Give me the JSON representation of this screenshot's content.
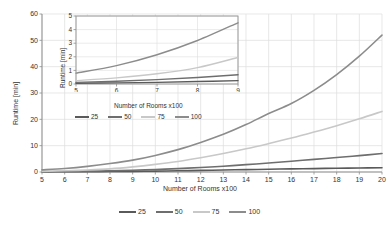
{
  "chart_data": [
    {
      "id": "main",
      "type": "line",
      "title": "",
      "xlabel": "Number of Rooms x100",
      "ylabel": "Runtime [min]",
      "xlim": [
        5,
        20
      ],
      "ylim": [
        0,
        60
      ],
      "xticks": [
        5,
        6,
        7,
        8,
        9,
        10,
        11,
        12,
        13,
        14,
        15,
        16,
        17,
        18,
        19,
        20
      ],
      "yticks": [
        0,
        10,
        20,
        30,
        40,
        50,
        60
      ],
      "xtick_labels": [
        "5",
        "6",
        "7",
        "8",
        "9",
        "10",
        "11",
        "12",
        "13",
        "14",
        "15",
        "16",
        "17",
        "18",
        "19",
        "20"
      ],
      "ytick_labels": [
        "0",
        "10",
        "20",
        "30",
        "40",
        "50",
        "60"
      ],
      "grid": true,
      "legend_position": "bottom",
      "x": [
        5,
        6,
        7,
        8,
        9,
        10,
        11,
        12,
        13,
        14,
        15,
        16,
        17,
        18,
        19,
        20
      ],
      "series": [
        {
          "name": "25",
          "color": "#5a5a5a",
          "values": [
            0.05,
            0.08,
            0.12,
            0.18,
            0.25,
            0.35,
            0.45,
            0.6,
            0.75,
            0.9,
            1.05,
            1.2,
            1.3,
            1.42,
            1.52,
            1.6
          ]
        },
        {
          "name": "50",
          "color": "#6e6e6e",
          "values": [
            0.12,
            0.2,
            0.32,
            0.48,
            0.68,
            0.95,
            1.3,
            1.7,
            2.2,
            2.8,
            3.4,
            4.1,
            4.8,
            5.5,
            6.2,
            7.0
          ]
        },
        {
          "name": "75",
          "color": "#c8c8c8",
          "values": [
            0.25,
            0.45,
            0.75,
            1.2,
            1.95,
            2.9,
            4.0,
            5.4,
            7.0,
            8.8,
            10.8,
            12.9,
            15.2,
            17.6,
            20.2,
            23.0
          ]
        },
        {
          "name": "100",
          "color": "#8c8c8c",
          "values": [
            0.8,
            1.35,
            2.15,
            3.2,
            4.5,
            6.3,
            8.5,
            11.2,
            14.3,
            18.0,
            22.2,
            26.0,
            31.0,
            37.0,
            44.0,
            52.0
          ]
        }
      ]
    },
    {
      "id": "inset",
      "type": "line",
      "title": "",
      "xlabel": "Number of Rooms x100",
      "ylabel": "Runtime [min]",
      "xlim": [
        5,
        9
      ],
      "ylim": [
        0,
        5
      ],
      "xticks": [
        5,
        6,
        7,
        8,
        9
      ],
      "yticks": [
        0,
        1,
        2,
        3,
        4,
        5
      ],
      "xtick_labels": [
        "5",
        "6",
        "7",
        "8",
        "9"
      ],
      "ytick_labels": [
        "0",
        "1",
        "2",
        "3",
        "4",
        "5"
      ],
      "grid": true,
      "legend_position": "bottom",
      "x": [
        5,
        6,
        7,
        8,
        9
      ],
      "series": [
        {
          "name": "25",
          "color": "#5a5a5a",
          "values": [
            0.05,
            0.08,
            0.12,
            0.18,
            0.25
          ]
        },
        {
          "name": "50",
          "color": "#6e6e6e",
          "values": [
            0.12,
            0.2,
            0.32,
            0.48,
            0.68
          ]
        },
        {
          "name": "75",
          "color": "#c8c8c8",
          "values": [
            0.25,
            0.45,
            0.75,
            1.2,
            1.95
          ]
        },
        {
          "name": "100",
          "color": "#8c8c8c",
          "values": [
            0.8,
            1.35,
            2.15,
            3.2,
            4.5
          ]
        }
      ]
    }
  ],
  "main": {
    "xlabel": "Number of Rooms x100",
    "ylabel": "Runtime [min]"
  },
  "inset": {
    "xlabel": "Number of Rooms x100",
    "ylabel": "Runtime [min]"
  },
  "legend": {
    "items": [
      {
        "label": "25",
        "color": "#5a5a5a"
      },
      {
        "label": "50",
        "color": "#6e6e6e"
      },
      {
        "label": "75",
        "color": "#c8c8c8"
      },
      {
        "label": "100",
        "color": "#8c8c8c"
      }
    ]
  },
  "inset_legend": {
    "items": [
      {
        "label": "25",
        "color": "#5a5a5a"
      },
      {
        "label": "50",
        "color": "#6e6e6e"
      },
      {
        "label": "75",
        "color": "#c8c8c8"
      },
      {
        "label": "100",
        "color": "#8c8c8c"
      }
    ]
  },
  "colors": {
    "axis": "#8d8d8d",
    "grid": "#dedede",
    "text": "#333333"
  }
}
